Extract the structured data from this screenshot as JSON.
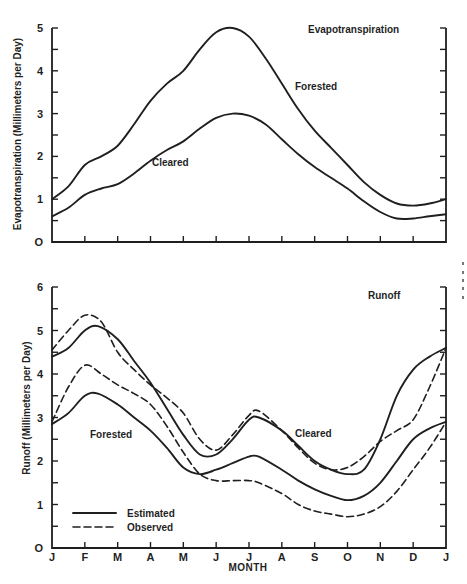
{
  "chart_data": [
    {
      "type": "line",
      "title": "Evapotranspiration",
      "xlabel": "",
      "ylabel": "Evapotranspiration (Millimeters per Day)",
      "ylim": [
        0,
        5
      ],
      "yticks": [
        0,
        1,
        2,
        3,
        4,
        5
      ],
      "y_minor_step": 0.5,
      "x_months": 13,
      "grid": false,
      "series": [
        {
          "name": "Forested",
          "style": "solid",
          "x": [
            0,
            0.5,
            1,
            1.5,
            2,
            2.5,
            3,
            3.5,
            4,
            4.5,
            5,
            5.5,
            6,
            6.5,
            7,
            7.5,
            8,
            8.5,
            9,
            9.5,
            10,
            10.5,
            11,
            11.5,
            12
          ],
          "values": [
            1.0,
            1.3,
            1.8,
            2.0,
            2.25,
            2.75,
            3.3,
            3.7,
            4.0,
            4.5,
            4.9,
            5.0,
            4.8,
            4.3,
            3.7,
            3.1,
            2.6,
            2.2,
            1.8,
            1.4,
            1.1,
            0.9,
            0.85,
            0.9,
            1.0
          ]
        },
        {
          "name": "Cleared",
          "style": "solid",
          "x": [
            0,
            0.5,
            1,
            1.5,
            2,
            2.5,
            3,
            3.5,
            4,
            4.5,
            5,
            5.5,
            6,
            6.5,
            7,
            7.5,
            8,
            8.5,
            9,
            9.5,
            10,
            10.5,
            11,
            11.5,
            12
          ],
          "values": [
            0.6,
            0.8,
            1.1,
            1.25,
            1.35,
            1.6,
            1.9,
            2.15,
            2.35,
            2.65,
            2.9,
            3.0,
            2.95,
            2.75,
            2.4,
            2.05,
            1.75,
            1.5,
            1.25,
            0.95,
            0.7,
            0.55,
            0.55,
            0.6,
            0.65
          ]
        }
      ],
      "annotations": [
        {
          "text": "Evapotranspiration",
          "x": 9.0,
          "y": 4.8
        },
        {
          "text": "Forested",
          "x": 7.9,
          "y": 3.9
        },
        {
          "text": "Cleared",
          "x": 3.2,
          "y": 1.8
        }
      ]
    },
    {
      "type": "line",
      "title": "Runoff",
      "xlabel": "MONTH",
      "ylabel": "Runoff (Millimeters per Day)",
      "ylim": [
        0,
        6
      ],
      "yticks": [
        0,
        1,
        2,
        3,
        4,
        5,
        6
      ],
      "y_minor_step": 0.5,
      "categories": [
        "J",
        "F",
        "M",
        "A",
        "M",
        "J",
        "J",
        "A",
        "S",
        "O",
        "N",
        "D",
        "J"
      ],
      "grid": false,
      "legend": {
        "position": "lower-left",
        "entries": [
          {
            "label": "Estimated",
            "style": "solid"
          },
          {
            "label": "Observed",
            "style": "dashed"
          }
        ]
      },
      "series": [
        {
          "name": "Cleared (Estimated)",
          "style": "solid",
          "x": [
            0,
            0.5,
            1,
            1.4,
            2,
            2.5,
            3,
            3.5,
            4,
            4.5,
            5,
            5.5,
            6,
            6.3,
            7,
            7.5,
            8,
            8.5,
            9,
            9.5,
            10,
            10.5,
            11,
            11.5,
            12
          ],
          "values": [
            4.4,
            4.6,
            5.0,
            5.1,
            4.8,
            4.3,
            3.8,
            3.2,
            2.6,
            2.15,
            2.15,
            2.5,
            2.95,
            3.0,
            2.7,
            2.35,
            2.0,
            1.8,
            1.7,
            1.8,
            2.5,
            3.5,
            4.1,
            4.4,
            4.6
          ]
        },
        {
          "name": "Cleared (Observed)",
          "style": "dashed",
          "x": [
            0,
            0.5,
            1,
            1.5,
            2,
            2.5,
            3,
            3.5,
            4,
            4.5,
            5,
            5.5,
            6,
            6.3,
            7,
            7.5,
            8,
            8.5,
            9,
            9.5,
            10,
            10.5,
            11,
            11.5,
            12
          ],
          "values": [
            4.55,
            5.0,
            5.35,
            5.2,
            4.5,
            4.1,
            3.75,
            3.45,
            3.1,
            2.5,
            2.25,
            2.6,
            3.05,
            3.15,
            2.7,
            2.3,
            1.95,
            1.8,
            1.85,
            2.1,
            2.45,
            2.7,
            2.95,
            3.7,
            4.6
          ]
        },
        {
          "name": "Forested (Estimated)",
          "style": "solid",
          "x": [
            0,
            0.5,
            1,
            1.4,
            2,
            2.5,
            3,
            3.5,
            4,
            4.5,
            5,
            5.5,
            6,
            6.3,
            7,
            7.5,
            8,
            8.5,
            9,
            9.5,
            10,
            10.5,
            11,
            11.5,
            12
          ],
          "values": [
            2.85,
            3.1,
            3.5,
            3.55,
            3.3,
            3.0,
            2.7,
            2.3,
            1.85,
            1.7,
            1.8,
            1.95,
            2.1,
            2.1,
            1.8,
            1.55,
            1.35,
            1.2,
            1.1,
            1.2,
            1.5,
            2.0,
            2.5,
            2.75,
            2.9
          ]
        },
        {
          "name": "Forested (Observed)",
          "style": "dashed",
          "x": [
            0,
            0.5,
            1,
            1.5,
            2,
            2.5,
            3,
            3.5,
            4,
            4.5,
            5,
            5.5,
            6,
            6.3,
            7,
            7.5,
            8,
            8.5,
            9,
            9.5,
            10,
            10.5,
            11,
            11.5,
            12
          ],
          "values": [
            2.9,
            3.7,
            4.2,
            4.0,
            3.75,
            3.55,
            3.3,
            2.8,
            2.2,
            1.7,
            1.55,
            1.55,
            1.55,
            1.5,
            1.25,
            1.0,
            0.85,
            0.78,
            0.72,
            0.78,
            0.95,
            1.3,
            1.8,
            2.3,
            2.9
          ]
        }
      ],
      "annotations": [
        {
          "text": "Runoff",
          "x": 10.0,
          "y": 5.6
        },
        {
          "text": "Forested",
          "x": 1.2,
          "y": 2.3
        },
        {
          "text": "Cleared",
          "x": 7.4,
          "y": 2.35
        }
      ]
    }
  ],
  "figure": {
    "top": {
      "title": "Evapotranspiration",
      "ylabel": "Evapotranspiration (Millimeters per Day)",
      "label_forested": "Forested",
      "label_cleared": "Cleared"
    },
    "bottom": {
      "title": "Runoff",
      "ylabel": "Runoff (Millimeters per Day)",
      "xlabel": "MONTH",
      "label_forested": "Forested",
      "label_cleared": "Cleared",
      "legend_estimated": "Estimated",
      "legend_observed": "Observed"
    },
    "ink_color": "#1f1f1f",
    "background": "#ffffff"
  }
}
